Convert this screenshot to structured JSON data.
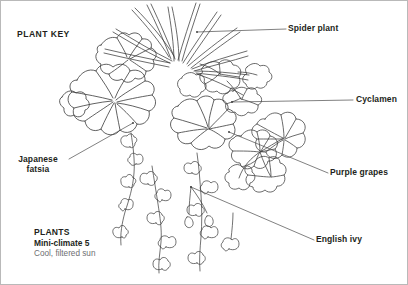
{
  "page": {
    "title": "PLANT KEY",
    "background_color": "#ffffff",
    "border_color": "#b9b9b9",
    "line_color": "#3a3a3a",
    "text_color": "#231f20",
    "muted_text_color": "#6d6e71"
  },
  "labels": {
    "spider_plant": "Spider plant",
    "cyclamen": "Cyclamen",
    "purple_grapes": "Purple grapes",
    "english_ivy": "English ivy",
    "japanese_fatsia": "Japanese fatsia"
  },
  "legend": {
    "title": "PLANTS",
    "subtitle": "Mini-climate 5",
    "note": "Cool, filtered sun"
  }
}
